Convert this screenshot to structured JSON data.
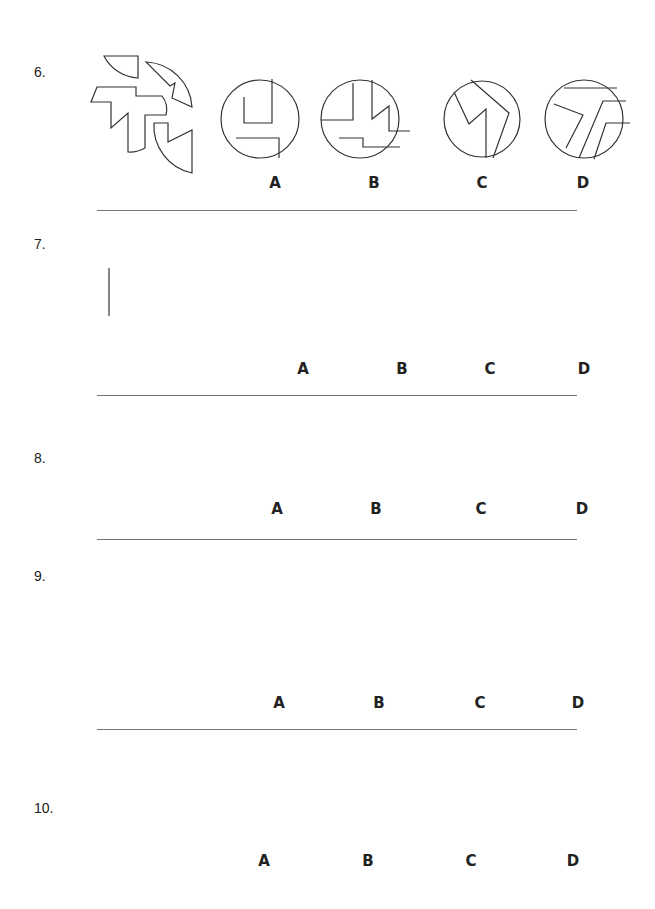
{
  "questions": [
    {
      "number": "6.",
      "type": "assemble-pieces-into-circle",
      "options": [
        "A",
        "B",
        "C",
        "D"
      ]
    },
    {
      "number": "7.",
      "type": "connect-points-A-B",
      "reference": {
        "point_top": "A",
        "point_bottom": "B",
        "shape_label_A": "A",
        "shape_label_B": "B"
      },
      "options": [
        "A",
        "B",
        "C",
        "D"
      ]
    },
    {
      "number": "8.",
      "type": "combine-shapes",
      "options": [
        "A",
        "B",
        "C",
        "D"
      ]
    },
    {
      "number": "9.",
      "type": "connect-points-A-B",
      "reference": {
        "point_top": "A",
        "point_bottom": "B",
        "shape_label_A": "A",
        "shape_label_B": "B"
      },
      "options": [
        "A",
        "B",
        "C",
        "D"
      ]
    },
    {
      "number": "10.",
      "type": "assemble-pieces-into-hexagon",
      "options": [
        "A",
        "B",
        "C",
        "D"
      ]
    }
  ],
  "colors": {
    "line": "#333333",
    "divider": "#777777",
    "background": "#ffffff"
  }
}
